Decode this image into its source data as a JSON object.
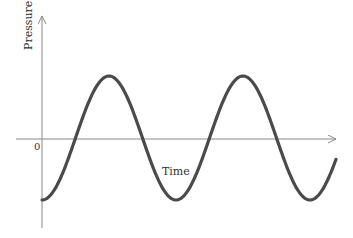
{
  "diagram": {
    "type": "waveform",
    "y_axis_label": "Pressure",
    "x_axis_label": "Time",
    "origin_label": "0",
    "wave": {
      "shape": "sinusoid",
      "start": "trough",
      "cycles_shown": 2.3,
      "axis_color": "#888888",
      "curve_color": "#4a4a4a"
    }
  }
}
